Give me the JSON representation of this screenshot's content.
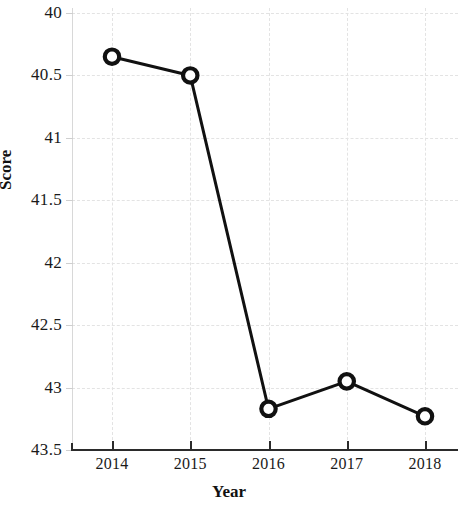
{
  "chart_data": {
    "type": "line",
    "title": "",
    "xlabel": "Year",
    "ylabel": "Score",
    "categories": [
      "2014",
      "2015",
      "2016",
      "2017",
      "2018"
    ],
    "x": [
      2014,
      2015,
      2016,
      2017,
      2018
    ],
    "values": [
      40.35,
      40.5,
      43.17,
      42.95,
      43.23
    ],
    "series": [
      {
        "name": "Score",
        "values": [
          40.35,
          40.5,
          43.17,
          42.95,
          43.23
        ]
      }
    ],
    "xlim": [
      2014,
      2018
    ],
    "ylim": [
      40,
      43.5
    ],
    "y_axis_inverted": true,
    "yticks": [
      "40",
      "40.5",
      "41",
      "41.5",
      "42",
      "42.5",
      "43",
      "43.5"
    ],
    "ytick_values": [
      40,
      40.5,
      41,
      41.5,
      42,
      42.5,
      43,
      43.5
    ],
    "xticks": [
      "2014",
      "2015",
      "2016",
      "2017",
      "2018"
    ],
    "grid": true,
    "legend": false,
    "marker": "open-circle",
    "line_color": "#111111",
    "marker_fill": "#ffffff",
    "marker_edge_color": "#111111",
    "grid_color": "#e3e3e3",
    "background_color": "#ffffff"
  }
}
